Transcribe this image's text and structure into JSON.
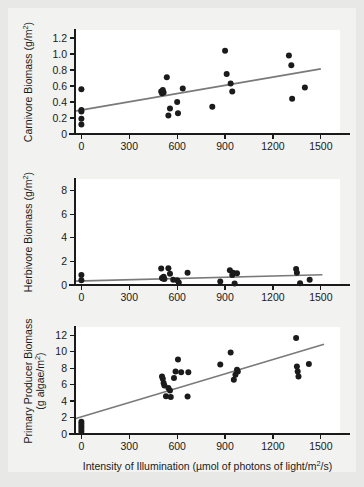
{
  "figure": {
    "background_color": "#e8e8e6",
    "card_color": "#f2f2f0",
    "plot_area_color": "#ffffff",
    "point_color": "#1b1b1b",
    "fit_line_color": "#7a7a7a",
    "axis_color": "#1a1a1a",
    "shared_xlabel_main": "Intensity of Illumination (µmol of photons of light/m",
    "shared_xlabel_sup": "2",
    "shared_xlabel_tail": "/s)"
  },
  "chart_data": [
    {
      "type": "scatter",
      "panel_index": 0,
      "panel_name": "carnivore-biomass",
      "title": "",
      "xlabel": "",
      "ylabel": "Carnivore Biomass (g/m²)",
      "ylabel_main": "Carnivore Biomass (g/m",
      "ylabel_sup": "2",
      "ylabel_tail": ")",
      "xlim": [
        -40,
        1620
      ],
      "ylim": [
        0,
        1.3
      ],
      "xticks": [
        0,
        300,
        600,
        900,
        1200,
        1500
      ],
      "xticklabels": [
        "0",
        "300",
        "600",
        "900",
        "1200",
        "1500"
      ],
      "yticks": [
        0,
        0.2,
        0.4,
        0.6,
        0.8,
        1.0,
        1.2
      ],
      "yticklabels": [
        "0",
        "0.2",
        "0.4",
        "0.6",
        "0.8",
        "1.0",
        "1.2"
      ],
      "grid": false,
      "legend": "none",
      "x": [
        0,
        0,
        0,
        0,
        0,
        500,
        505,
        510,
        515,
        535,
        545,
        555,
        600,
        605,
        635,
        820,
        900,
        910,
        935,
        945,
        1300,
        1315,
        1320,
        1400
      ],
      "y": [
        0.56,
        0.3,
        0.28,
        0.19,
        0.12,
        0.53,
        0.51,
        0.55,
        0.52,
        0.71,
        0.23,
        0.32,
        0.4,
        0.26,
        0.57,
        0.34,
        1.04,
        0.75,
        0.63,
        0.53,
        0.98,
        0.86,
        0.44,
        0.58
      ],
      "fit_line": {
        "x": [
          -40,
          1500
        ],
        "y": [
          0.285,
          0.815
        ]
      }
    },
    {
      "type": "scatter",
      "panel_index": 1,
      "panel_name": "herbivore-biomass",
      "title": "",
      "xlabel": "",
      "ylabel": "Herbivore Biomass (g/m²)",
      "ylabel_main": "Herbivore Biomass (g/m",
      "ylabel_sup": "2",
      "ylabel_tail": ")",
      "xlim": [
        -40,
        1620
      ],
      "ylim": [
        0,
        9
      ],
      "xticks": [
        0,
        300,
        600,
        900,
        1200,
        1500
      ],
      "xticklabels": [
        "0",
        "300",
        "600",
        "900",
        "1200",
        "1500"
      ],
      "yticks": [
        0,
        2,
        4,
        6,
        8
      ],
      "yticklabels": [
        "0",
        "2",
        "4",
        "6",
        "8"
      ],
      "grid": false,
      "legend": "none",
      "x": [
        0,
        0,
        500,
        505,
        510,
        515,
        520,
        545,
        555,
        575,
        600,
        610,
        665,
        870,
        930,
        945,
        950,
        960,
        975,
        1345,
        1350,
        1370,
        1430
      ],
      "y": [
        0.85,
        0.4,
        1.4,
        0.6,
        0.55,
        0.7,
        0.5,
        1.42,
        0.95,
        0.45,
        0.4,
        0.22,
        1.05,
        0.3,
        1.25,
        0.85,
        1.05,
        0.12,
        1.0,
        1.35,
        1.05,
        0.15,
        0.45
      ],
      "fit_line": {
        "x": [
          -40,
          1510
        ],
        "y": [
          0.33,
          0.87
        ]
      }
    },
    {
      "type": "scatter",
      "panel_index": 2,
      "panel_name": "primary-producer-biomass",
      "title": "",
      "xlabel": "Intensity of Illumination (µmol of photons of light/m²/s)",
      "ylabel": "Primary Producer Biomass (g algae/m²)",
      "ylabel_line1": "Primary Producer Biomass",
      "ylabel_line2_main": "(g algae/m",
      "ylabel_line2_sup": "2",
      "ylabel_line2_tail": ")",
      "xlim": [
        -40,
        1620
      ],
      "ylim": [
        0,
        13
      ],
      "xticks": [
        0,
        300,
        600,
        900,
        1200,
        1500
      ],
      "xticklabels": [
        "0",
        "300",
        "600",
        "900",
        "1200",
        "1500"
      ],
      "yticks": [
        0,
        2,
        4,
        6,
        8,
        10,
        12
      ],
      "yticklabels": [
        "0",
        "2",
        "4",
        "6",
        "8",
        "10",
        "12"
      ],
      "grid": false,
      "legend": "none",
      "x": [
        0,
        0,
        0,
        0,
        0,
        505,
        510,
        515,
        520,
        530,
        545,
        555,
        560,
        580,
        590,
        605,
        625,
        665,
        670,
        870,
        935,
        955,
        965,
        975,
        980,
        1345,
        1350,
        1355,
        1360,
        1425
      ],
      "y": [
        1.5,
        1.2,
        0.9,
        0.6,
        0.3,
        7.0,
        6.7,
        6.2,
        5.9,
        4.6,
        5.6,
        5.3,
        4.5,
        6.8,
        7.6,
        9.05,
        7.5,
        4.55,
        7.5,
        8.45,
        9.9,
        6.6,
        7.2,
        7.8,
        7.6,
        11.65,
        8.2,
        7.6,
        7.0,
        8.5
      ],
      "fit_line": {
        "x": [
          -40,
          1520
        ],
        "y": [
          1.85,
          10.9
        ]
      }
    }
  ]
}
